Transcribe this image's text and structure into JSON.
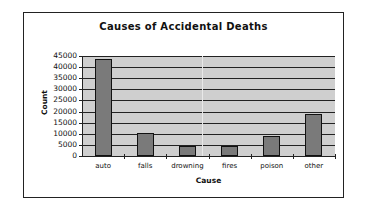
{
  "chart_data": {
    "type": "bar",
    "title": "Causes of Accidental Deaths",
    "xlabel": "Cause",
    "ylabel": "Count",
    "categories": [
      "auto",
      "falls",
      "drowning",
      "fires",
      "poison",
      "other"
    ],
    "values": [
      43500,
      10500,
      4500,
      4300,
      9000,
      19000
    ],
    "ylim": [
      0,
      45000
    ],
    "yticks": [
      "0",
      "5000",
      "10000",
      "15000",
      "20000",
      "25000",
      "30000",
      "35000",
      "40000",
      "45000"
    ],
    "grid": true,
    "legend": "none",
    "colors": {
      "bar": "#7a7a7a",
      "plot_background": "#cfcfcf",
      "gridline": "#222222"
    }
  }
}
